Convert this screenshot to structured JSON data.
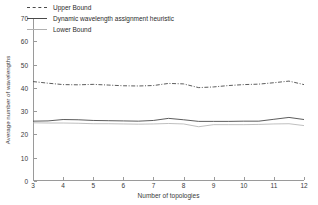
{
  "chart_data": {
    "type": "line",
    "title": "",
    "xlabel": "Number of topologies",
    "ylabel": "Average number of wavelengths",
    "xlim": [
      3,
      12
    ],
    "ylim": [
      0,
      70
    ],
    "xticks": [
      3,
      4,
      5,
      6,
      7,
      8,
      9,
      10,
      11,
      12
    ],
    "yticks": [
      0,
      10,
      20,
      30,
      40,
      50,
      60,
      70
    ],
    "grid": false,
    "legend_position": "upper-left",
    "x": [
      3,
      3.5,
      4,
      4.5,
      5,
      5.5,
      6,
      6.5,
      7,
      7.5,
      8,
      8.5,
      9,
      9.5,
      10,
      10.5,
      11,
      11.5,
      12
    ],
    "series": [
      {
        "name": "Upper Bound",
        "style": "dash-dot",
        "color": "#4a4a4a",
        "values": [
          42.7,
          42.0,
          41.4,
          41.3,
          41.5,
          41.2,
          40.9,
          40.8,
          41.0,
          41.9,
          41.7,
          40.1,
          40.4,
          41.0,
          41.4,
          41.6,
          42.2,
          42.9,
          41.4
        ]
      },
      {
        "name": "Dynamic wavelength assignment heuristic",
        "style": "solid",
        "color": "#4a4a4a",
        "values": [
          25.7,
          25.8,
          26.4,
          26.3,
          26.0,
          25.9,
          25.8,
          25.7,
          26.0,
          26.9,
          26.3,
          25.6,
          25.6,
          25.6,
          25.7,
          25.7,
          26.5,
          27.3,
          26.4
        ]
      },
      {
        "name": "Lower Bound",
        "style": "solid-light",
        "color": "#b0b0b0",
        "values": [
          25.0,
          24.9,
          24.9,
          24.8,
          24.6,
          24.6,
          24.5,
          24.4,
          24.5,
          24.7,
          24.5,
          23.3,
          24.2,
          24.2,
          24.2,
          24.3,
          24.5,
          24.6,
          23.8
        ]
      }
    ],
    "legend": [
      {
        "label": "Upper Bound",
        "style": "dash-dot",
        "color": "#4a4a4a"
      },
      {
        "label": "Dynamic wavelength assignment heuristic",
        "style": "solid",
        "color": "#4a4a4a"
      },
      {
        "label": "Lower Bound",
        "style": "solid-light",
        "color": "#b0b0b0"
      }
    ],
    "axis_color": "#9a9a9a",
    "text_color": "#3a3a3a"
  }
}
